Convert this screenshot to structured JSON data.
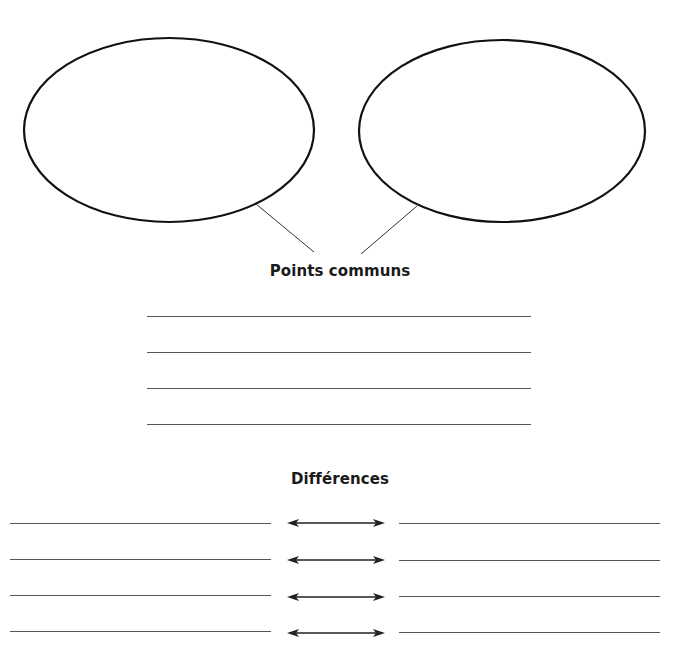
{
  "worksheet": {
    "bubbles": [
      {
        "id": "left",
        "cx": 169,
        "cy": 130,
        "rx": 145,
        "ry": 92,
        "connector": {
          "x1": 256,
          "y1": 204,
          "x2": 314,
          "y2": 252
        }
      },
      {
        "id": "right",
        "cx": 502,
        "cy": 131,
        "rx": 143,
        "ry": 91,
        "connector": {
          "x1": 417,
          "y1": 206,
          "x2": 361,
          "y2": 254
        }
      }
    ],
    "common_section": {
      "title": "Points communs",
      "lines": 4
    },
    "differences_section": {
      "title": "Différences",
      "rows": 4,
      "arrow_icon": "double-arrow-icon"
    },
    "colors": {
      "ink": "#111111",
      "rule": "#555555",
      "background": "#ffffff"
    }
  }
}
